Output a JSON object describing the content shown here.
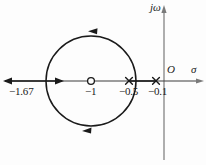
{
  "figure": {
    "kind": "root-locus-s-plane",
    "stroke_color": "#1a1a1a",
    "axis_color": "#6a6a6a",
    "background": "#fdfdfd"
  },
  "axes": {
    "real_axis_label": "σ",
    "imaginary_axis_label": "jω",
    "origin_label": "O",
    "real_axis_y_px": 81,
    "imaginary_axis_x_px": 164
  },
  "tick_labels": [
    {
      "name": "breakaway-point",
      "text": "−1.67",
      "value": -1.67,
      "x_px": 46
    },
    {
      "name": "open-loop-zero",
      "text": "−1",
      "value": -1.0,
      "x_px": 91
    },
    {
      "name": "open-loop-pole-a",
      "text": "−0.5",
      "value": -0.5,
      "x_px": 129
    },
    {
      "name": "open-loop-pole-b",
      "text": "−0.1",
      "value": -0.1,
      "x_px": 156
    }
  ],
  "markers": {
    "zeros": [
      {
        "label": "−1",
        "value": -1.0,
        "x_px": 91,
        "y_px": 81,
        "symbol": "circle"
      }
    ],
    "poles": [
      {
        "label": "−0.5",
        "value": -0.5,
        "x_px": 129,
        "y_px": 81,
        "symbol": "cross"
      },
      {
        "label": "−0.1",
        "value": -0.1,
        "x_px": 156,
        "y_px": 81,
        "symbol": "cross"
      }
    ]
  },
  "locus": {
    "circle": {
      "center_x_px": 91,
      "center_y_px": 81,
      "radius_px": 45,
      "center_value": -1.0,
      "radius_value": 0.67,
      "direction": "counterclockwise"
    },
    "direction_arrows": [
      {
        "name": "locus-arrow-top",
        "x_px": 95,
        "y_px": 31,
        "points": "left"
      },
      {
        "name": "locus-arrow-bottom",
        "x_px": 88,
        "y_px": 131,
        "points": "left"
      }
    ],
    "real_axis_arrows": [
      {
        "name": "real-axis-arrow-left",
        "x_px": 6,
        "y_px": 81,
        "points": "left"
      },
      {
        "name": "real-axis-arrow-right",
        "x_px": 62,
        "y_px": 81,
        "points": "right"
      }
    ]
  }
}
